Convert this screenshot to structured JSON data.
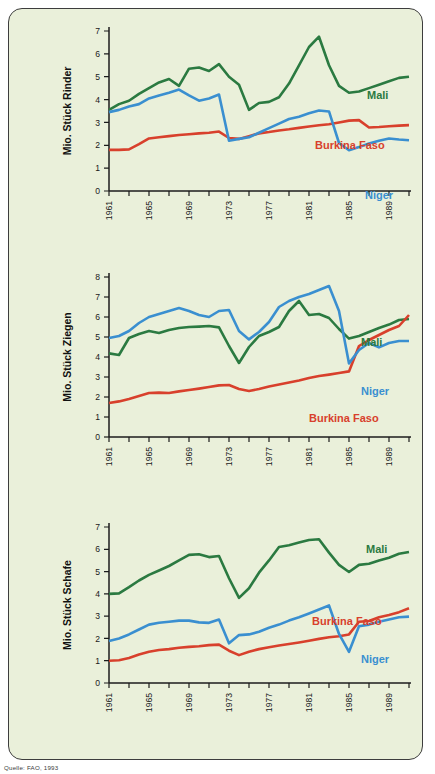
{
  "figure": {
    "background_color": "#eaf0da",
    "source_note": "Quelle: FAO, 1993"
  },
  "colors": {
    "mali": "#2b7a41",
    "burkina_faso": "#d8402c",
    "niger": "#3a8fd0",
    "axis": "#1c1c1c",
    "text": "#111111"
  },
  "chart_data": [
    {
      "type": "line",
      "title": "",
      "ylabel": "Mio. Stück Rinder",
      "xlabel": "",
      "ylim": [
        0,
        7
      ],
      "yticks": [
        0,
        1,
        2,
        3,
        4,
        5,
        6,
        7
      ],
      "xlim": [
        1961,
        1991
      ],
      "xticks": [
        1961,
        1963,
        1965,
        1967,
        1969,
        1971,
        1973,
        1975,
        1977,
        1979,
        1981,
        1983,
        1985,
        1987,
        1989,
        1991
      ],
      "xticklabels": [
        "1961",
        "",
        "1965",
        "",
        "1969",
        "",
        "1973",
        "",
        "1977",
        "",
        "1981",
        "",
        "1985",
        "",
        "1989",
        ""
      ],
      "grid": false,
      "legend_position": "inline-right",
      "x": [
        1961,
        1962,
        1963,
        1964,
        1965,
        1966,
        1967,
        1968,
        1969,
        1970,
        1971,
        1972,
        1973,
        1974,
        1975,
        1976,
        1977,
        1978,
        1979,
        1980,
        1981,
        1982,
        1983,
        1984,
        1985,
        1986,
        1987,
        1988,
        1989,
        1990,
        1991
      ],
      "series": [
        {
          "name": "Mali",
          "color": "#2b7a41",
          "values": [
            3.55,
            3.8,
            3.95,
            4.25,
            4.5,
            4.75,
            4.9,
            4.6,
            5.35,
            5.4,
            5.25,
            5.55,
            5.0,
            4.65,
            3.55,
            3.85,
            3.9,
            4.1,
            4.7,
            5.5,
            6.3,
            6.75,
            5.5,
            4.6,
            4.3,
            4.35,
            4.5,
            4.65,
            4.8,
            4.95,
            5.0
          ]
        },
        {
          "name": "Burkina Faso",
          "color": "#d8402c",
          "values": [
            1.8,
            1.8,
            1.82,
            2.05,
            2.3,
            2.35,
            2.4,
            2.45,
            2.48,
            2.52,
            2.55,
            2.6,
            2.32,
            2.28,
            2.4,
            2.52,
            2.58,
            2.65,
            2.7,
            2.76,
            2.82,
            2.88,
            2.92,
            3.0,
            3.08,
            3.1,
            2.78,
            2.8,
            2.83,
            2.86,
            2.88
          ]
        },
        {
          "name": "Niger",
          "color": "#3a8fd0",
          "values": [
            3.45,
            3.55,
            3.7,
            3.8,
            4.05,
            4.18,
            4.3,
            4.44,
            4.18,
            3.95,
            4.05,
            4.22,
            2.2,
            2.28,
            2.35,
            2.55,
            2.75,
            2.95,
            3.15,
            3.25,
            3.4,
            3.52,
            3.48,
            2.1,
            1.78,
            1.92,
            2.08,
            2.2,
            2.3,
            2.25,
            2.22
          ]
        }
      ]
    },
    {
      "type": "line",
      "title": "",
      "ylabel": "Mio. Stück Ziegen",
      "xlabel": "",
      "ylim": [
        0,
        8
      ],
      "yticks": [
        0,
        1,
        2,
        3,
        4,
        5,
        6,
        7,
        8
      ],
      "xlim": [
        1961,
        1991
      ],
      "xticks": [
        1961,
        1963,
        1965,
        1967,
        1969,
        1971,
        1973,
        1975,
        1977,
        1979,
        1981,
        1983,
        1985,
        1987,
        1989,
        1991
      ],
      "xticklabels": [
        "1961",
        "",
        "1965",
        "",
        "1969",
        "",
        "1973",
        "",
        "1977",
        "",
        "1981",
        "",
        "1985",
        "",
        "1989",
        ""
      ],
      "grid": false,
      "legend_position": "inline-right",
      "x": [
        1961,
        1962,
        1963,
        1964,
        1965,
        1966,
        1967,
        1968,
        1969,
        1970,
        1971,
        1972,
        1973,
        1974,
        1975,
        1976,
        1977,
        1978,
        1979,
        1980,
        1981,
        1982,
        1983,
        1984,
        1985,
        1986,
        1987,
        1988,
        1989,
        1990,
        1991
      ],
      "series": [
        {
          "name": "Mali",
          "color": "#2b7a41",
          "values": [
            4.18,
            4.1,
            4.95,
            5.15,
            5.3,
            5.2,
            5.35,
            5.45,
            5.5,
            5.52,
            5.55,
            5.48,
            4.55,
            3.7,
            4.5,
            5.05,
            5.25,
            5.5,
            6.3,
            6.8,
            6.1,
            6.15,
            5.95,
            5.4,
            4.92,
            5.05,
            5.25,
            5.45,
            5.62,
            5.85,
            5.9
          ]
        },
        {
          "name": "Burkina Faso",
          "color": "#d8402c",
          "values": [
            1.7,
            1.78,
            1.9,
            2.05,
            2.2,
            2.22,
            2.2,
            2.28,
            2.35,
            2.42,
            2.5,
            2.58,
            2.6,
            2.4,
            2.3,
            2.4,
            2.52,
            2.62,
            2.72,
            2.82,
            2.95,
            3.05,
            3.12,
            3.2,
            3.28,
            4.55,
            4.85,
            5.1,
            5.35,
            5.55,
            6.1
          ]
        },
        {
          "name": "Niger",
          "color": "#3a8fd0",
          "values": [
            4.95,
            5.05,
            5.3,
            5.7,
            6.0,
            6.15,
            6.3,
            6.45,
            6.3,
            6.1,
            6.0,
            6.3,
            6.35,
            5.3,
            4.88,
            5.25,
            5.75,
            6.5,
            6.8,
            7.0,
            7.15,
            7.35,
            7.55,
            6.3,
            3.68,
            4.35,
            4.7,
            4.48,
            4.7,
            4.8,
            4.8
          ]
        }
      ]
    },
    {
      "type": "line",
      "title": "",
      "ylabel": "Mio. Stück Schafe",
      "xlabel": "",
      "ylim": [
        0,
        7
      ],
      "yticks": [
        0,
        1,
        2,
        3,
        4,
        5,
        6,
        7
      ],
      "xlim": [
        1961,
        1991
      ],
      "xticks": [
        1961,
        1963,
        1965,
        1967,
        1969,
        1971,
        1973,
        1975,
        1977,
        1979,
        1981,
        1983,
        1985,
        1987,
        1989,
        1991
      ],
      "xticklabels": [
        "1961",
        "",
        "1965",
        "",
        "1969",
        "",
        "1973",
        "",
        "1977",
        "",
        "1981",
        "",
        "1985",
        "",
        "1989",
        ""
      ],
      "grid": false,
      "legend_position": "inline-right",
      "x": [
        1961,
        1962,
        1963,
        1964,
        1965,
        1966,
        1967,
        1968,
        1969,
        1970,
        1971,
        1972,
        1973,
        1974,
        1975,
        1976,
        1977,
        1978,
        1979,
        1980,
        1981,
        1982,
        1983,
        1984,
        1985,
        1986,
        1987,
        1988,
        1989,
        1990,
        1991
      ],
      "series": [
        {
          "name": "Mali",
          "color": "#2b7a41",
          "values": [
            4.0,
            4.02,
            4.3,
            4.6,
            4.85,
            5.05,
            5.25,
            5.5,
            5.75,
            5.78,
            5.65,
            5.7,
            4.7,
            3.82,
            4.25,
            4.95,
            5.5,
            6.1,
            6.18,
            6.3,
            6.42,
            6.45,
            5.85,
            5.3,
            4.98,
            5.3,
            5.35,
            5.5,
            5.62,
            5.8,
            5.88
          ]
        },
        {
          "name": "Burkina Faso",
          "color": "#d8402c",
          "values": [
            1.0,
            1.02,
            1.12,
            1.28,
            1.4,
            1.48,
            1.52,
            1.58,
            1.62,
            1.65,
            1.7,
            1.72,
            1.45,
            1.25,
            1.4,
            1.52,
            1.6,
            1.68,
            1.75,
            1.82,
            1.9,
            1.98,
            2.05,
            2.1,
            2.18,
            2.75,
            2.78,
            2.95,
            3.05,
            3.18,
            3.35
          ]
        },
        {
          "name": "Niger",
          "color": "#3a8fd0",
          "values": [
            1.88,
            2.0,
            2.18,
            2.4,
            2.62,
            2.7,
            2.75,
            2.8,
            2.8,
            2.72,
            2.7,
            2.85,
            1.78,
            2.15,
            2.18,
            2.3,
            2.48,
            2.62,
            2.8,
            2.95,
            3.12,
            3.3,
            3.48,
            2.2,
            1.4,
            2.55,
            2.62,
            2.75,
            2.85,
            2.95,
            2.98
          ]
        }
      ]
    }
  ]
}
